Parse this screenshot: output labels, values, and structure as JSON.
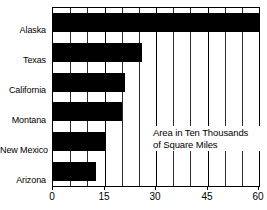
{
  "chart_data": {
    "type": "bar",
    "orientation": "horizontal",
    "title": "",
    "subtitle": "",
    "annotation": "Area in Ten Thousands of Square Miles",
    "annotation_lines": [
      "Area in Ten Thousands",
      "of Square Miles"
    ],
    "categories": [
      "Alaska",
      "Texas",
      "California",
      "Montana",
      "New Mexico",
      "Arizona"
    ],
    "values": [
      60,
      26,
      21,
      20,
      15,
      12.5
    ],
    "xlabel": "",
    "ylabel": "",
    "xlim": [
      0,
      60
    ],
    "x_ticks": [
      0,
      15,
      30,
      45,
      60
    ],
    "x_tick_labels": [
      "0",
      "15",
      "30",
      "45",
      "60"
    ],
    "x_minor_ticks": [
      5,
      10,
      20,
      25,
      35,
      40,
      50,
      55
    ],
    "grid": true,
    "grid_axis": "x",
    "legend": false,
    "bar_color": "#000000",
    "background_color": "#ffffff",
    "axis_color": "#000000"
  },
  "axis": {
    "category_labels": [
      {
        "label": "Alaska"
      },
      {
        "label": "Texas"
      },
      {
        "label": "California"
      },
      {
        "label": "Montana"
      },
      {
        "label": "New Mexico"
      },
      {
        "label": "Arizona"
      }
    ],
    "x_tick_labels": [
      {
        "label": "0"
      },
      {
        "label": "15"
      },
      {
        "label": "30"
      },
      {
        "label": "45"
      },
      {
        "label": "60"
      }
    ]
  },
  "annotation": {
    "line1": "Area in Ten Thousands",
    "line2": "of Square Miles"
  }
}
